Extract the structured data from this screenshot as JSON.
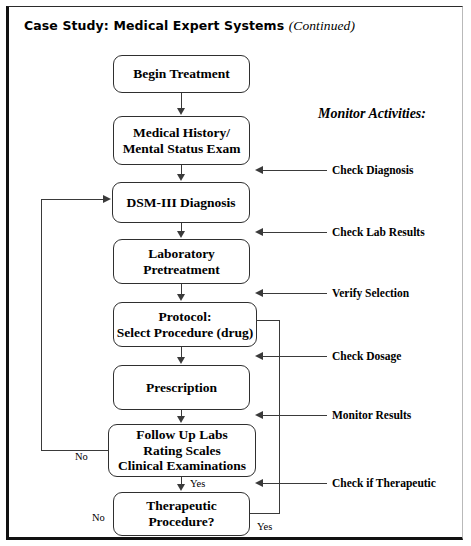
{
  "page": {
    "title_main": "Case Study: Medical Expert Systems",
    "title_continued": "(Continued)"
  },
  "monitor": {
    "heading": "Monitor Activities:"
  },
  "flow": {
    "nodes": [
      {
        "id": "begin-treatment",
        "lines": [
          "Begin Treatment"
        ]
      },
      {
        "id": "medical-history",
        "lines": [
          "Medical History/",
          "Mental Status Exam"
        ]
      },
      {
        "id": "dsm-iii-diagnosis",
        "lines": [
          "DSM-III Diagnosis"
        ]
      },
      {
        "id": "laboratory-pretreatment",
        "lines": [
          "Laboratory",
          "Pretreatment"
        ]
      },
      {
        "id": "protocol",
        "lines": [
          "Protocol:",
          "Select Procedure (drug)"
        ]
      },
      {
        "id": "prescription",
        "lines": [
          "Prescription"
        ]
      },
      {
        "id": "follow-up-labs",
        "lines": [
          "Follow Up Labs",
          "Rating Scales",
          "Clinical Examinations"
        ]
      },
      {
        "id": "therapeutic-procedure",
        "lines": [
          "Therapeutic",
          "Procedure?"
        ]
      }
    ]
  },
  "annotations": [
    {
      "id": "check-diagnosis",
      "label": "Check Diagnosis"
    },
    {
      "id": "check-lab-results",
      "label": "Check Lab Results"
    },
    {
      "id": "verify-selection",
      "label": "Verify Selection"
    },
    {
      "id": "check-dosage",
      "label": "Check Dosage"
    },
    {
      "id": "monitor-results",
      "label": "Monitor Results"
    },
    {
      "id": "check-if-therapeutic",
      "label": "Check if Therapeutic"
    }
  ],
  "branch_labels": {
    "follow_up_no": "No",
    "follow_up_yes": "Yes",
    "therapeutic_no": "No",
    "therapeutic_yes": "Yes"
  },
  "colors": {
    "ink": "#000000",
    "line": "#3a3a3a",
    "frame": "#111111",
    "background": "#ffffff"
  }
}
